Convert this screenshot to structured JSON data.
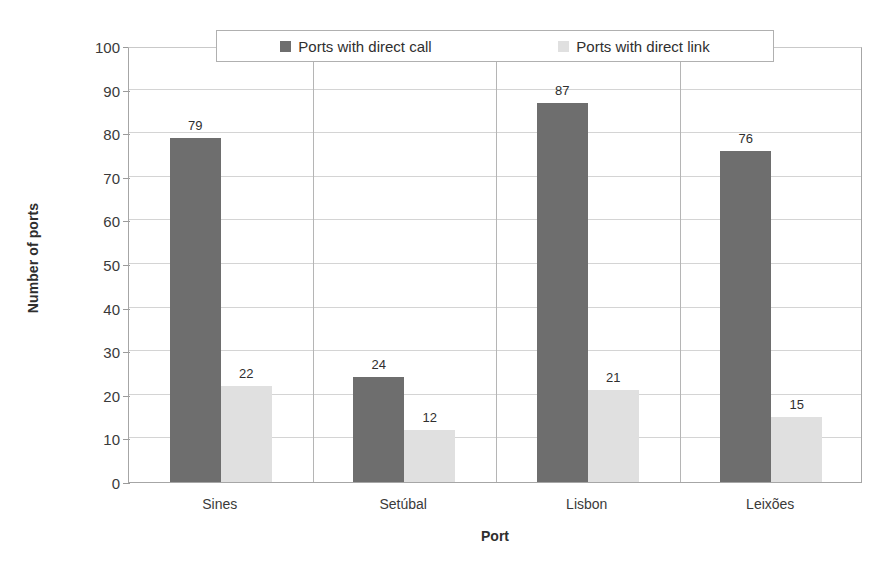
{
  "chart_data": {
    "type": "bar",
    "title": "",
    "subtitle": "",
    "xlabel": "Port",
    "ylabel": "Number of ports",
    "categories": [
      "Sines",
      "Setúbal",
      "Lisbon",
      "Leixões"
    ],
    "series": [
      {
        "name": "Ports with direct call",
        "color": "#6e6e6e",
        "values": [
          79,
          24,
          87,
          76
        ]
      },
      {
        "name": "Ports with direct link",
        "color": "#e0e0e0",
        "values": [
          22,
          12,
          21,
          15
        ]
      }
    ],
    "ylim": [
      0,
      100
    ],
    "ytick_step": 10,
    "yticks": [
      100,
      90,
      80,
      70,
      60,
      50,
      40,
      30,
      20,
      10,
      0
    ],
    "ytick_labels": [
      "100",
      "90",
      "80",
      "70",
      "60",
      "50",
      "40",
      "30",
      "20",
      "10",
      "0"
    ],
    "grid": "horizontal",
    "data_labels": true,
    "legend_position": "top-inside",
    "plot_border": true
  },
  "axis": {
    "y_title": "Number of ports",
    "x_title": "Port"
  },
  "legend": {
    "entries": [
      {
        "label": "Ports with direct call",
        "swatch": "dark-gray-swatch-icon"
      },
      {
        "label": "Ports with direct link",
        "swatch": "light-gray-swatch-icon"
      }
    ]
  },
  "colors": {
    "series_call": "#6e6e6e",
    "series_link": "#e0e0e0",
    "gridline": "#d4d4d4",
    "axis_line": "#a6a6a6",
    "text": "#3a3a3a"
  }
}
